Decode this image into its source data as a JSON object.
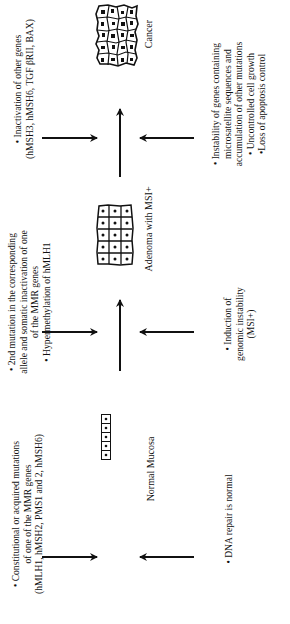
{
  "diagram": {
    "stages": [
      {
        "name": "Normal Mucosa",
        "top_text": {
          "line1": "• Constitutional or acquired mutations",
          "line2": "of one of the MMR genes",
          "line3": "(hMLH1, hMSH2, PMS1 and 2, hMSH6)"
        },
        "bottom_text": {
          "line1": "• DNA repair is normal"
        }
      },
      {
        "name": "Adenoma with MSI+",
        "top_text": {
          "line1": "• 2nd mutation in the corresponding",
          "line2": "allele and somatic inactivation of one",
          "line3": "of the MMR genes",
          "line4": "• Hypermethylation of hMLH1"
        },
        "bottom_text": {
          "line1": "• Induction of",
          "line2": "genomic instability",
          "line3": "(MSI+)"
        }
      },
      {
        "name": "Cancer",
        "top_text": {
          "line1": "• Inactivation of other genes",
          "line2": "(hMSH3, hMSH6, TGF βRII, BAX)"
        },
        "bottom_text": {
          "line1": "• Instability of genes containing",
          "line2": "microsatellite sequences and",
          "line3": "accumulation of other mutations",
          "line4": "• Uncontrolled cell growth",
          "line5": "•Loss of apoptosis control"
        }
      }
    ],
    "orientation": "rotated 90° counter-clockwise",
    "colors": {
      "ink": "#111111",
      "background": "#ffffff"
    }
  }
}
